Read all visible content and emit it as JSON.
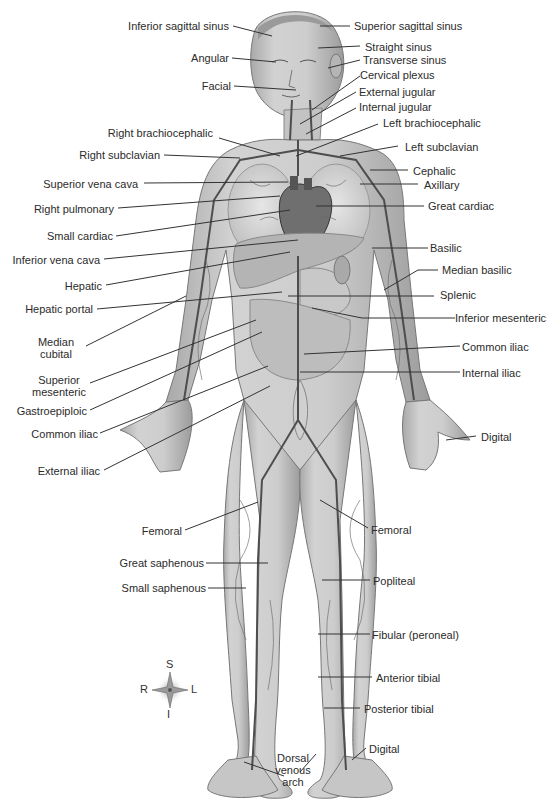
{
  "figure": {
    "colors": {
      "background": "#ffffff",
      "skin": "#cfcfcf",
      "skin_dark": "#9a9a9a",
      "vein": "#555555",
      "leader": "#333333",
      "text": "#2b2b2b"
    }
  },
  "labels_left": [
    {
      "id": "inferior-sagittal-sinus",
      "text": "Inferior sagittal sinus"
    },
    {
      "id": "angular",
      "text": "Angular"
    },
    {
      "id": "facial",
      "text": "Facial"
    },
    {
      "id": "right-brachiocephalic",
      "text": "Right brachiocephalic"
    },
    {
      "id": "right-subclavian",
      "text": "Right subclavian"
    },
    {
      "id": "superior-vena-cava",
      "text": "Superior vena cava"
    },
    {
      "id": "right-pulmonary",
      "text": "Right pulmonary"
    },
    {
      "id": "small-cardiac",
      "text": "Small cardiac"
    },
    {
      "id": "inferior-vena-cava",
      "text": "Inferior vena cava"
    },
    {
      "id": "hepatic",
      "text": "Hepatic"
    },
    {
      "id": "hepatic-portal",
      "text": "Hepatic portal"
    },
    {
      "id": "median-cubital",
      "text": "Median\ncubital"
    },
    {
      "id": "superior-mesenteric",
      "text": "Superior\nmesenteric"
    },
    {
      "id": "gastroepiploic",
      "text": "Gastroepiploic"
    },
    {
      "id": "common-iliac-left",
      "text": "Common iliac"
    },
    {
      "id": "external-iliac",
      "text": "External iliac"
    },
    {
      "id": "femoral-left",
      "text": "Femoral"
    },
    {
      "id": "great-saphenous",
      "text": "Great saphenous"
    },
    {
      "id": "small-saphenous",
      "text": "Small saphenous"
    }
  ],
  "labels_right": [
    {
      "id": "superior-sagittal-sinus",
      "text": "Superior sagittal sinus"
    },
    {
      "id": "straight-sinus",
      "text": "Straight sinus"
    },
    {
      "id": "transverse-sinus",
      "text": "Transverse sinus"
    },
    {
      "id": "cervical-plexus",
      "text": "Cervical plexus"
    },
    {
      "id": "external-jugular",
      "text": "External jugular"
    },
    {
      "id": "internal-jugular",
      "text": "Internal jugular"
    },
    {
      "id": "left-brachiocephalic",
      "text": "Left brachiocephalic"
    },
    {
      "id": "left-subclavian",
      "text": "Left subclavian"
    },
    {
      "id": "cephalic",
      "text": "Cephalic"
    },
    {
      "id": "axillary",
      "text": "Axillary"
    },
    {
      "id": "great-cardiac",
      "text": "Great cardiac"
    },
    {
      "id": "basilic",
      "text": "Basilic"
    },
    {
      "id": "median-basilic",
      "text": "Median basilic"
    },
    {
      "id": "splenic",
      "text": "Splenic"
    },
    {
      "id": "inferior-mesenteric",
      "text": "Inferior mesenteric"
    },
    {
      "id": "common-iliac-right",
      "text": "Common iliac"
    },
    {
      "id": "internal-iliac",
      "text": "Internal iliac"
    },
    {
      "id": "digital-hand",
      "text": "Digital"
    },
    {
      "id": "femoral-right",
      "text": "Femoral"
    },
    {
      "id": "popliteal",
      "text": "Popliteal"
    },
    {
      "id": "fibular",
      "text": "Fibular (peroneal)"
    },
    {
      "id": "anterior-tibial",
      "text": "Anterior tibial"
    },
    {
      "id": "posterior-tibial",
      "text": "Posterior tibial"
    },
    {
      "id": "digital-foot",
      "text": "Digital"
    }
  ],
  "labels_bottom": [
    {
      "id": "dorsal-venous-arch",
      "text": "Dorsal\nvenous\narch"
    }
  ],
  "compass": {
    "superior": "S",
    "inferior": "I",
    "right": "R",
    "left": "L"
  }
}
